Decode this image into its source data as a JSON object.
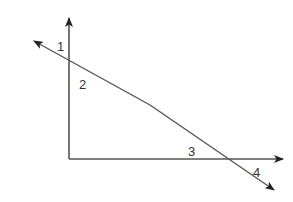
{
  "diagram": {
    "type": "geometry-angles",
    "colors": {
      "line": "#555555",
      "arrow": "#222222",
      "label": "#333333"
    },
    "angle_labels": [
      {
        "id": "1",
        "text": "1"
      },
      {
        "id": "2",
        "text": "2"
      },
      {
        "id": "3",
        "text": "3"
      },
      {
        "id": "4",
        "text": "4"
      }
    ],
    "lines": [
      {
        "name": "vertical-ray",
        "from": [
          69,
          159
        ],
        "to": [
          69,
          17
        ]
      },
      {
        "name": "horizontal-ray",
        "from": [
          69,
          159
        ],
        "to": [
          284,
          159
        ]
      },
      {
        "name": "transversal",
        "from": [
          33,
          40
        ],
        "to": [
          275,
          191
        ]
      }
    ]
  }
}
